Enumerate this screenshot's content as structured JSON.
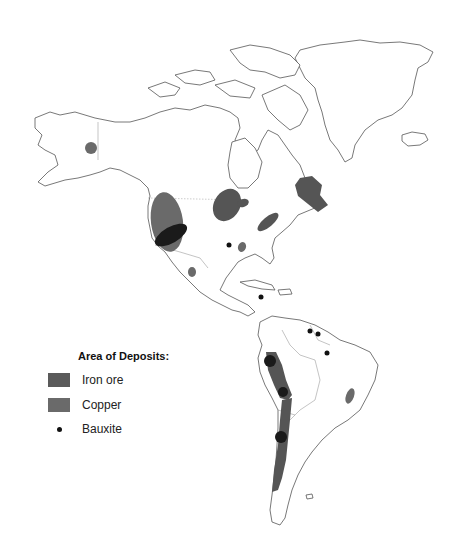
{
  "map": {
    "region": "North and South America",
    "colors": {
      "iron_ore": "#5a5a5a",
      "copper": "#6a6a6a",
      "overlap": "#1a1a1a",
      "bauxite": "#111111",
      "coastline": "#555555"
    }
  },
  "legend": {
    "title": "Area of Deposits:",
    "items": [
      {
        "label": "Iron ore",
        "symbol": "shaded-area"
      },
      {
        "label": "Copper",
        "symbol": "shaded-area"
      },
      {
        "label": "Bauxite",
        "symbol": "dot"
      }
    ]
  }
}
